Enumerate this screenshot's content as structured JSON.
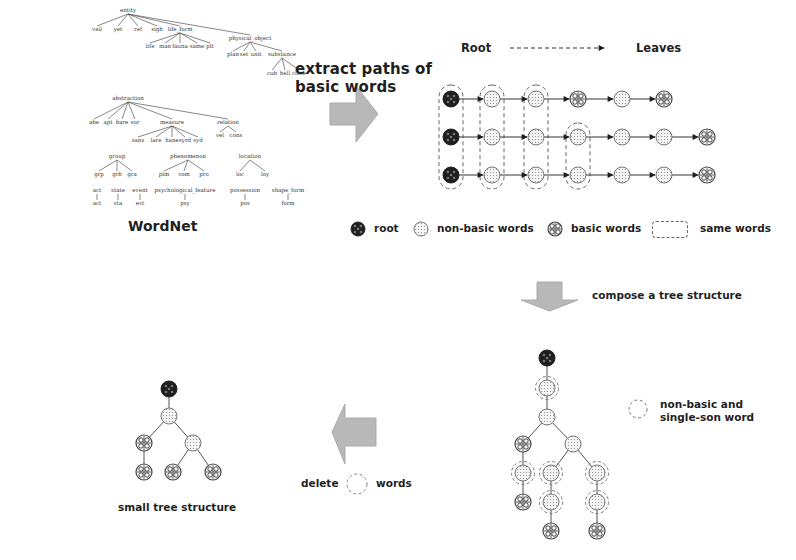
{
  "wordnet": {
    "title": "WordNet",
    "tree_nodes": [
      {
        "id": "entity",
        "label": "entity",
        "x": 88,
        "y": 12
      },
      {
        "id": "e1",
        "label": "veil",
        "x": 57,
        "y": 31,
        "parent": "entity"
      },
      {
        "id": "e2",
        "label": "yet",
        "x": 78,
        "y": 31,
        "parent": "entity"
      },
      {
        "id": "e3",
        "label": "ref",
        "x": 98,
        "y": 31,
        "parent": "entity"
      },
      {
        "id": "e4",
        "label": "sigh",
        "x": 117,
        "y": 31,
        "parent": "entity"
      },
      {
        "id": "life_form",
        "label": "life_form",
        "x": 140,
        "y": 31,
        "parent": "entity"
      },
      {
        "id": "lf1",
        "label": "life",
        "x": 110,
        "y": 48,
        "parent": "life_form"
      },
      {
        "id": "lf2",
        "label": "man",
        "x": 125,
        "y": 48,
        "parent": "life_form"
      },
      {
        "id": "lf3",
        "label": "fauna",
        "x": 140,
        "y": 48,
        "parent": "life_form"
      },
      {
        "id": "lf4",
        "label": "same",
        "x": 157,
        "y": 48,
        "parent": "life_form"
      },
      {
        "id": "lf5",
        "label": "plt",
        "x": 170,
        "y": 48,
        "parent": "life_form"
      },
      {
        "id": "physical_object",
        "label": "physical_object",
        "x": 210,
        "y": 40,
        "parent": "entity"
      },
      {
        "id": "po1",
        "label": "plan",
        "x": 193,
        "y": 56,
        "parent": "physical_object"
      },
      {
        "id": "po2",
        "label": "set",
        "x": 204,
        "y": 56,
        "parent": "physical_object"
      },
      {
        "id": "po3",
        "label": "unit",
        "x": 216,
        "y": 56,
        "parent": "physical_object"
      },
      {
        "id": "substance",
        "label": "substance",
        "x": 242,
        "y": 56,
        "parent": "physical_object"
      },
      {
        "id": "s1",
        "label": "cub",
        "x": 232,
        "y": 75,
        "parent": "substance"
      },
      {
        "id": "s2",
        "label": "bell",
        "x": 245,
        "y": 75,
        "parent": "substance"
      },
      {
        "id": "s3",
        "label": "close",
        "x": 259,
        "y": 75,
        "parent": "substance"
      },
      {
        "id": "abstraction",
        "label": "abstraction",
        "x": 88,
        "y": 100
      },
      {
        "id": "a1",
        "label": "abe",
        "x": 54,
        "y": 124,
        "parent": "abstraction"
      },
      {
        "id": "a2",
        "label": "apt",
        "x": 68,
        "y": 124,
        "parent": "abstraction"
      },
      {
        "id": "a3",
        "label": "hare",
        "x": 82,
        "y": 124,
        "parent": "abstraction"
      },
      {
        "id": "a4",
        "label": "sor",
        "x": 95,
        "y": 124,
        "parent": "abstraction"
      },
      {
        "id": "measure",
        "label": "measure",
        "x": 132,
        "y": 124,
        "parent": "abstraction"
      },
      {
        "id": "m1",
        "label": "sans",
        "x": 98,
        "y": 142,
        "parent": "measure"
      },
      {
        "id": "m2",
        "label": "lare",
        "x": 116,
        "y": 142,
        "parent": "measure"
      },
      {
        "id": "m3",
        "label": "hane",
        "x": 132,
        "y": 142,
        "parent": "measure"
      },
      {
        "id": "m4",
        "label": "syrd",
        "x": 145,
        "y": 142,
        "parent": "measure"
      },
      {
        "id": "m5",
        "label": "syd",
        "x": 158,
        "y": 142,
        "parent": "measure"
      },
      {
        "id": "relation",
        "label": "relation",
        "x": 188,
        "y": 124,
        "parent": "abstraction"
      },
      {
        "id": "r1",
        "label": "vel",
        "x": 180,
        "y": 137,
        "parent": "relation"
      },
      {
        "id": "r2",
        "label": "cons",
        "x": 196,
        "y": 137,
        "parent": "relation"
      },
      {
        "id": "group",
        "label": "group",
        "x": 77,
        "y": 158
      },
      {
        "id": "g1",
        "label": "grp",
        "x": 59,
        "y": 176,
        "parent": "group"
      },
      {
        "id": "g2",
        "label": "grb",
        "x": 77,
        "y": 176,
        "parent": "group"
      },
      {
        "id": "g3",
        "label": "gra",
        "x": 92,
        "y": 176,
        "parent": "group"
      },
      {
        "id": "phenomenon",
        "label": "phenomenon",
        "x": 148,
        "y": 158
      },
      {
        "id": "p1",
        "label": "plm",
        "x": 124,
        "y": 176,
        "parent": "phenomenon"
      },
      {
        "id": "p2",
        "label": "vom",
        "x": 144,
        "y": 176,
        "parent": "phenomenon"
      },
      {
        "id": "p3",
        "label": "pro",
        "x": 164,
        "y": 176,
        "parent": "phenomenon"
      },
      {
        "id": "location",
        "label": "location",
        "x": 210,
        "y": 158
      },
      {
        "id": "l1",
        "label": "loc",
        "x": 200,
        "y": 176,
        "parent": "location"
      },
      {
        "id": "l2",
        "label": "loy",
        "x": 225,
        "y": 176,
        "parent": "location"
      },
      {
        "id": "act",
        "label": "act",
        "x": 57,
        "y": 192
      },
      {
        "id": "act_c",
        "label": "act",
        "x": 57,
        "y": 205,
        "parent": "act"
      },
      {
        "id": "state",
        "label": "state",
        "x": 78,
        "y": 192
      },
      {
        "id": "state_c",
        "label": "sta",
        "x": 78,
        "y": 205,
        "parent": "state"
      },
      {
        "id": "event",
        "label": "event",
        "x": 100,
        "y": 192
      },
      {
        "id": "event_c",
        "label": "evt",
        "x": 100,
        "y": 205,
        "parent": "event"
      },
      {
        "id": "psych",
        "label": "psychological_feature",
        "x": 145,
        "y": 192
      },
      {
        "id": "psych_c",
        "label": "psy",
        "x": 145,
        "y": 205,
        "parent": "psych"
      },
      {
        "id": "possession",
        "label": "possession",
        "x": 205,
        "y": 192
      },
      {
        "id": "poss_c",
        "label": "pos",
        "x": 205,
        "y": 205,
        "parent": "possession"
      },
      {
        "id": "shape",
        "label": "shape_form",
        "x": 248,
        "y": 192
      },
      {
        "id": "shape_c",
        "label": "form",
        "x": 248,
        "y": 205,
        "parent": "shape"
      }
    ]
  },
  "step1": {
    "label_line1": "extract paths of",
    "label_line2": "basic words"
  },
  "paths": {
    "root_label": "Root",
    "leaves_label": "Leaves",
    "columns_x": [
      451,
      492,
      536,
      578,
      622,
      664,
      707
    ],
    "rows": [
      {
        "y": 99,
        "nodes": [
          "root",
          "nonbasic",
          "nonbasic",
          "basic",
          "nonbasic",
          "basic"
        ]
      },
      {
        "y": 137,
        "nodes": [
          "root",
          "nonbasic",
          "nonbasic",
          "nonbasic",
          "nonbasic",
          "nonbasic",
          "basic"
        ]
      },
      {
        "y": 175,
        "nodes": [
          "root",
          "nonbasic",
          "nonbasic",
          "nonbasic",
          "nonbasic",
          "nonbasic",
          "basic"
        ]
      }
    ],
    "same_word_groups": [
      {
        "col": 0,
        "row_from": 0,
        "row_to": 2
      },
      {
        "col": 1,
        "row_from": 0,
        "row_to": 2
      },
      {
        "col": 2,
        "row_from": 0,
        "row_to": 2
      },
      {
        "col": 3,
        "row_from": 1,
        "row_to": 2
      }
    ]
  },
  "legend": {
    "root": "root",
    "nonbasic": "non-basic words",
    "basic": "basic words",
    "same": "same words"
  },
  "step2": {
    "label": "compose a tree structure"
  },
  "composed_tree": {
    "nodes": [
      {
        "id": "n0",
        "x": 547,
        "y": 358,
        "type": "root"
      },
      {
        "id": "n1",
        "x": 547,
        "y": 388,
        "type": "nonbasic",
        "single_son": true,
        "parent": "n0"
      },
      {
        "id": "n2",
        "x": 547,
        "y": 417,
        "type": "nonbasic",
        "parent": "n1"
      },
      {
        "id": "n3",
        "x": 523,
        "y": 444,
        "type": "basic",
        "parent": "n2"
      },
      {
        "id": "n4",
        "x": 573,
        "y": 444,
        "type": "nonbasic",
        "parent": "n2"
      },
      {
        "id": "n5",
        "x": 523,
        "y": 473,
        "type": "nonbasic",
        "single_son": true,
        "parent": "n3"
      },
      {
        "id": "n6",
        "x": 523,
        "y": 502,
        "type": "basic",
        "parent": "n5"
      },
      {
        "id": "n7",
        "x": 551,
        "y": 473,
        "type": "nonbasic",
        "single_son": true,
        "parent": "n4"
      },
      {
        "id": "n8",
        "x": 551,
        "y": 502,
        "type": "nonbasic",
        "single_son": true,
        "parent": "n7"
      },
      {
        "id": "n9",
        "x": 551,
        "y": 531,
        "type": "basic",
        "parent": "n8"
      },
      {
        "id": "n10",
        "x": 597,
        "y": 473,
        "type": "nonbasic",
        "single_son": true,
        "parent": "n4"
      },
      {
        "id": "n11",
        "x": 597,
        "y": 502,
        "type": "nonbasic",
        "single_son": true,
        "parent": "n10"
      },
      {
        "id": "n12",
        "x": 597,
        "y": 531,
        "type": "basic",
        "parent": "n11"
      }
    ]
  },
  "single_son_legend": {
    "line1": "non-basic and",
    "line2": "single-son word"
  },
  "step3": {
    "delete_label": "delete",
    "words_label": "words"
  },
  "small_tree": {
    "title": "small tree structure",
    "nodes": [
      {
        "id": "s0",
        "x": 169,
        "y": 389,
        "type": "root"
      },
      {
        "id": "s1",
        "x": 169,
        "y": 416,
        "type": "nonbasic",
        "parent": "s0"
      },
      {
        "id": "s2",
        "x": 144,
        "y": 443,
        "type": "basic",
        "parent": "s1"
      },
      {
        "id": "s3",
        "x": 193,
        "y": 443,
        "type": "nonbasic",
        "parent": "s1"
      },
      {
        "id": "s4",
        "x": 144,
        "y": 472,
        "type": "basic",
        "parent": "s2"
      },
      {
        "id": "s5",
        "x": 173,
        "y": 472,
        "type": "basic",
        "parent": "s3"
      },
      {
        "id": "s6",
        "x": 213,
        "y": 472,
        "type": "basic",
        "parent": "s3"
      }
    ]
  },
  "colors": {
    "arrow_fill": "#b8b8b8",
    "arrow_stroke": "#a8a8a8",
    "node_stroke": "#555555",
    "root_fill": "#1e1e1e",
    "dash": "#666666"
  }
}
